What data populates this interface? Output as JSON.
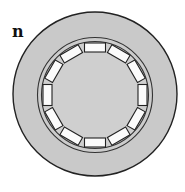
{
  "figure": {
    "panel_label": "n",
    "block_count": 12,
    "colors": {
      "outer_disc": "#c9c9c9",
      "inner_field": "#cfcfcf",
      "stroke": "#222222",
      "block_fill": "#fbfbfb"
    }
  }
}
